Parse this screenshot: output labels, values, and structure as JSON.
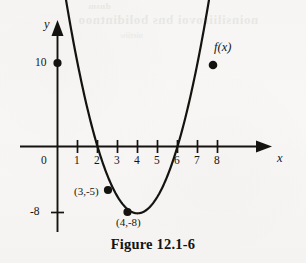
{
  "figure": {
    "caption": "Figure 12.1-6",
    "curve_label": "f(x)",
    "axis_labels": {
      "x": "x",
      "y": "y"
    },
    "origin_label": "0"
  },
  "bleed_text": {
    "line1": "dnsm",
    "line2": "noinsiliirovoi bns bolidintnoo",
    "line3": "nietiiw"
  },
  "chart_data": {
    "type": "line",
    "title": "Figure 12.1-6",
    "xlabel": "x",
    "ylabel": "y",
    "grid": false,
    "legend": "none",
    "xlim": [
      -1.2,
      9.8
    ],
    "ylim": [
      -11.5,
      13.5
    ],
    "x_ticks": [
      {
        "value": 1,
        "label": "1"
      },
      {
        "value": 2,
        "label": "2"
      },
      {
        "value": 3,
        "label": "3"
      },
      {
        "value": 4,
        "label": "4"
      },
      {
        "value": 5,
        "label": "5"
      },
      {
        "value": 6,
        "label": "6"
      },
      {
        "value": 7,
        "label": "7"
      },
      {
        "value": 8,
        "label": "8"
      }
    ],
    "y_ticks": [
      {
        "value": 10,
        "label": "10"
      },
      {
        "value": -8,
        "label": "-8"
      }
    ],
    "series": [
      {
        "name": "f(x)",
        "kind": "parabola",
        "equation": "y = 2(x - 4)^2 - 8",
        "domain": [
          0,
          8.3
        ],
        "x": [
          0,
          1,
          2,
          3,
          4,
          5,
          6,
          7,
          8,
          8.3
        ],
        "values": [
          10,
          4,
          0,
          -5,
          -8,
          -5,
          0,
          4,
          10,
          12
        ]
      }
    ],
    "annotations": [
      {
        "label": "(3,-5)",
        "x": 3,
        "y": -5,
        "marker": true
      },
      {
        "label": "(4,-8)",
        "x": 4,
        "y": -8,
        "marker": true
      },
      {
        "label": "",
        "x": 0,
        "y": 10,
        "marker": true
      },
      {
        "label": "f(x)",
        "x": 8.3,
        "y": 12,
        "marker": true
      }
    ],
    "x_intercepts": [
      2,
      6.9
    ],
    "y_intercept": 10,
    "vertex": {
      "x": 4,
      "y": -8
    }
  }
}
